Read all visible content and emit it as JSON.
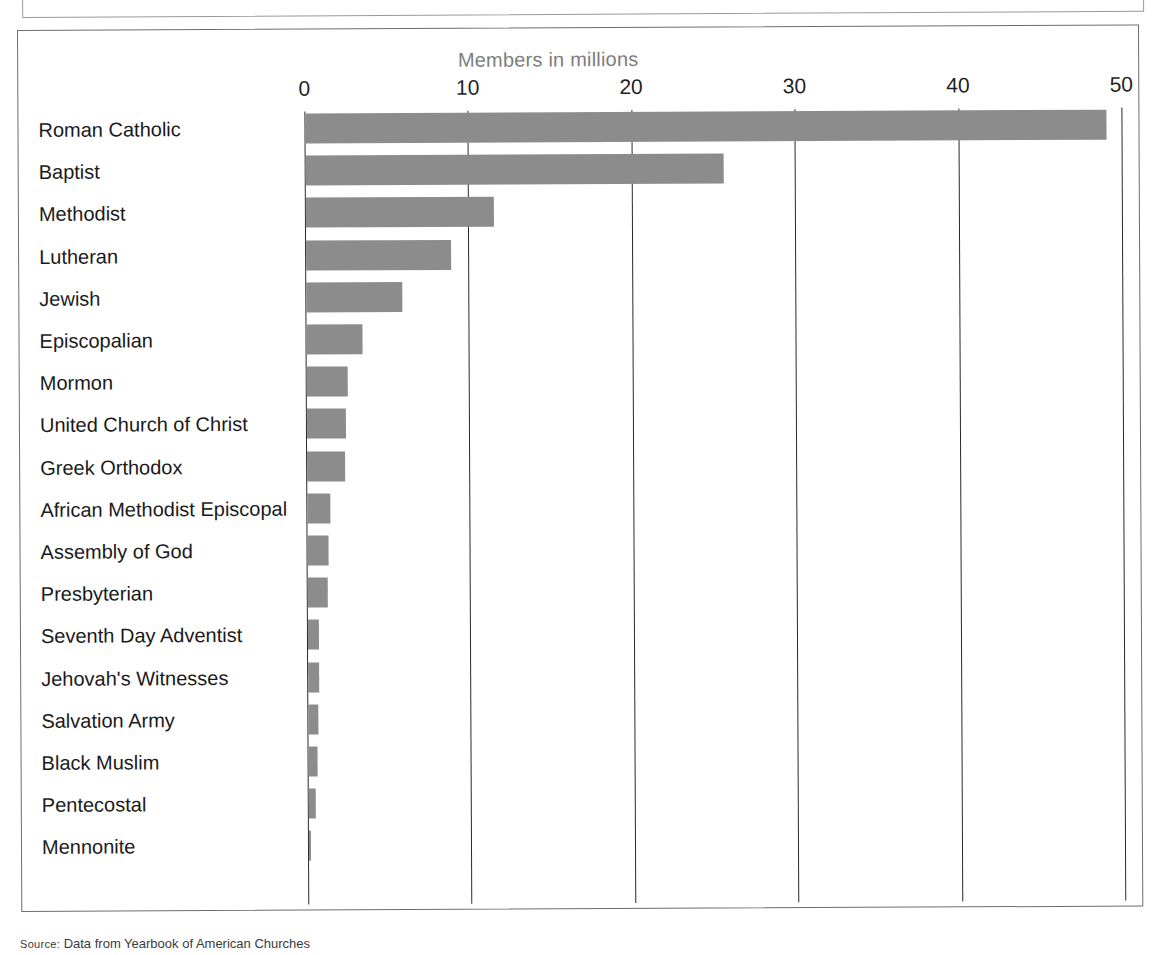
{
  "figure": {
    "axis_title": "Members in millions",
    "source_prefix": "Source:",
    "source_text": "Data from Yearbook of American Churches"
  },
  "colors": {
    "bar": "#8c8c8c",
    "gridline": "#2a2a2a",
    "frame": "#6e6e6e",
    "axis_title": "#7d7d7d",
    "label": "#1a1a1a"
  },
  "chart_data": {
    "type": "bar",
    "orientation": "horizontal",
    "title": "Members in millions",
    "xlabel": "Members in millions",
    "ylabel": "",
    "xlim": [
      0,
      50
    ],
    "xticks": [
      0,
      10,
      20,
      30,
      40,
      50
    ],
    "xtick_labels": [
      "0",
      "10",
      "20",
      "30",
      "40",
      "50"
    ],
    "grid": true,
    "grid_axis": "x",
    "legend": false,
    "categories": [
      "Roman Catholic",
      "Baptist",
      "Methodist",
      "Lutheran",
      "Jewish",
      "Episcopalian",
      "Mormon",
      "United Church of Christ",
      "Greek Orthodox",
      "African Methodist Episcopal",
      "Assembly of God",
      "Presbyterian",
      "Seventh Day Adventist",
      "Jehovah's Witnesses",
      "Salvation Army",
      "Black Muslim",
      "Pentecostal",
      "Mennonite"
    ],
    "values": [
      49.0,
      25.6,
      11.5,
      8.9,
      5.9,
      3.4,
      2.5,
      2.4,
      2.3,
      1.4,
      1.3,
      1.2,
      0.7,
      0.65,
      0.6,
      0.55,
      0.45,
      0.15
    ]
  }
}
